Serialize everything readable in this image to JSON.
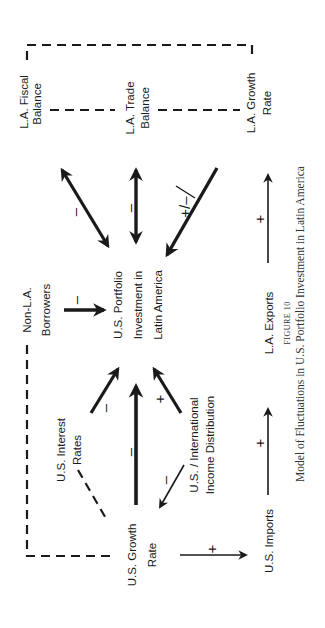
{
  "figure": {
    "number_label": "FIGURE 10",
    "caption": "Model of Fluctuations in U.S. Portfolio Investment in Latin America",
    "orientation": "rotated 90° counter-clockwise"
  },
  "nodes": {
    "la_fiscal": {
      "line1": "L.A. Fiscal",
      "line2": "Balance"
    },
    "la_trade": {
      "line1": "L.A. Trade",
      "line2": "Balance"
    },
    "la_growth": {
      "line1": "L.A. Growth",
      "line2": "Rate"
    },
    "non_la": {
      "line1": "Non-L.A.",
      "line2": "Borrowers"
    },
    "center": {
      "line1": "U.S. Portfolio",
      "line2": "Investment in",
      "line3": "Latin America"
    },
    "us_interest": {
      "line1": "U.S. Interest",
      "line2": "Rates"
    },
    "us_income": {
      "line1": "U.S. / International",
      "line2": "Income Distribution"
    },
    "us_growth": {
      "line1": "U.S. Growth",
      "line2": "Rate"
    },
    "us_imports": {
      "line1": "U.S. Imports"
    },
    "la_exports": {
      "line1": "L.A. Exports"
    }
  },
  "links": {
    "center_fiscal": "–",
    "center_trade": "–",
    "growth_center": "+/–",
    "nonla_center": "–",
    "interest_center": "–",
    "usgrowth_center": "–",
    "income_center": "+",
    "income_usgrowth": "–",
    "usgrowth_imports": "+",
    "imports_exports": "+",
    "exports_lagrowth": "+"
  },
  "colors": {
    "ink": "#1a1a1a",
    "paper": "#ffffff"
  }
}
